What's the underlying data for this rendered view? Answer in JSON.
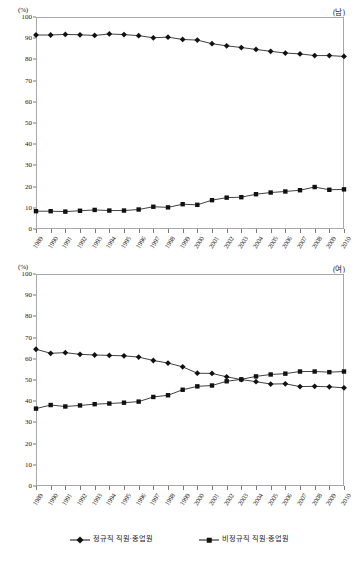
{
  "charts": [
    {
      "panel_id": "male",
      "unit_label": "(%)",
      "sex_label": "(남)",
      "chart_data": {
        "type": "line",
        "title": "",
        "subtitle": "",
        "xlabel": "",
        "ylabel": "(%)",
        "ylim": [
          0,
          100
        ],
        "yticks": [
          0,
          10,
          20,
          30,
          40,
          50,
          60,
          70,
          80,
          90,
          100
        ],
        "grid": false,
        "legend_position": "bottom",
        "annotation": "(남)",
        "x": [
          "1989",
          "1990",
          "1991",
          "1992",
          "1993",
          "1994",
          "1995",
          "1996",
          "1997",
          "1998",
          "1999",
          "2000",
          "2001",
          "2002",
          "2003",
          "2004",
          "2005",
          "2006",
          "2007",
          "2008",
          "2009",
          "2010"
        ],
        "series": [
          {
            "name": "정규직 직원·종업원",
            "marker": "diamond",
            "values": [
              91.5,
              91.5,
              91.8,
              91.6,
              91.3,
              92.0,
              91.7,
              91.2,
              90.2,
              90.5,
              89.4,
              89.1,
              87.4,
              86.4,
              85.6,
              84.7,
              83.8,
              83.0,
              82.6,
              81.8,
              81.8,
              81.4
            ]
          },
          {
            "name": "비정규직 직원·종업원",
            "marker": "square",
            "values": [
              8.4,
              8.4,
              8.2,
              8.6,
              9.0,
              8.7,
              8.7,
              9.2,
              10.5,
              10.2,
              11.7,
              11.4,
              13.6,
              14.8,
              15.0,
              16.4,
              17.2,
              17.7,
              18.3,
              19.8,
              18.5,
              18.7
            ]
          }
        ]
      }
    },
    {
      "panel_id": "female",
      "unit_label": "(%)",
      "sex_label": "(여)",
      "chart_data": {
        "type": "line",
        "title": "",
        "subtitle": "",
        "xlabel": "",
        "ylabel": "(%)",
        "ylim": [
          0,
          100
        ],
        "yticks": [
          0,
          10,
          20,
          30,
          40,
          50,
          60,
          70,
          80,
          90,
          100
        ],
        "grid": false,
        "legend_position": "bottom",
        "annotation": "(여)",
        "x": [
          "1989",
          "1990",
          "1991",
          "1992",
          "1993",
          "1994",
          "1995",
          "1996",
          "1997",
          "1998",
          "1999",
          "2000",
          "2001",
          "2002",
          "2003",
          "2004",
          "2005",
          "2006",
          "2007",
          "2008",
          "2009",
          "2010"
        ],
        "series": [
          {
            "name": "정규직 직원·종업원",
            "marker": "diamond",
            "values": [
              64.5,
              62.6,
              62.9,
              62.1,
              61.8,
              61.6,
              61.4,
              60.8,
              59.2,
              58.0,
              56.2,
              53.2,
              53.1,
              51.5,
              50.2,
              49.2,
              48.1,
              48.2,
              46.9,
              47.0,
              46.8,
              46.3
            ]
          },
          {
            "name": "비정규직 직원·종업원",
            "marker": "square",
            "values": [
              36.5,
              38.2,
              37.5,
              38.0,
              38.6,
              38.9,
              39.3,
              39.8,
              42.0,
              42.8,
              45.4,
              47.0,
              47.4,
              49.4,
              50.3,
              51.7,
              52.6,
              53.0,
              54.0,
              54.0,
              53.7,
              54.0
            ]
          }
        ]
      }
    }
  ],
  "legend": {
    "items": [
      {
        "label": "정규직 직원·종업원",
        "marker": "diamond",
        "color": "#111111"
      },
      {
        "label": "비정규직 직원·종업원",
        "marker": "square",
        "color": "#111111"
      }
    ]
  },
  "style": {
    "line_color": "#111111",
    "marker_color": "#111111",
    "axis_color": "#a8a8a8",
    "tick_color": "#7a7a7a",
    "background": "#ffffff"
  }
}
